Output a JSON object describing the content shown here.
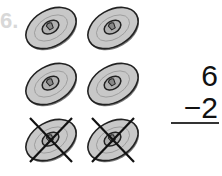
{
  "problem_number": "6.",
  "disks": [
    {
      "row": 0,
      "col": 0,
      "crossed": false
    },
    {
      "row": 0,
      "col": 1,
      "crossed": false
    },
    {
      "row": 1,
      "col": 0,
      "crossed": false
    },
    {
      "row": 1,
      "col": 1,
      "crossed": false
    },
    {
      "row": 2,
      "col": 0,
      "crossed": true
    },
    {
      "row": 2,
      "col": 1,
      "crossed": true
    }
  ],
  "equation": {
    "top": "6",
    "operator": "−",
    "bottom": "2",
    "answer": ""
  }
}
